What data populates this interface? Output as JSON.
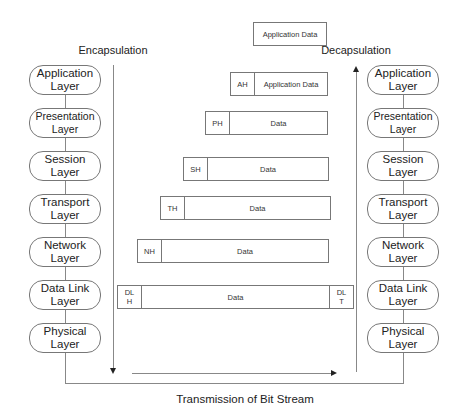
{
  "diagram": {
    "encapsulation_label": "Encapsulation",
    "decapsulation_label": "Decapsulation",
    "transmission_label": "Transmission of Bit Stream",
    "top_data_label": "Application Data",
    "layers_left": [
      {
        "line1": "Application",
        "line2": "Layer"
      },
      {
        "line1": "Presentation",
        "line2": "Layer"
      },
      {
        "line1": "Session",
        "line2": "Layer"
      },
      {
        "line1": "Transport",
        "line2": "Layer"
      },
      {
        "line1": "Network",
        "line2": "Layer"
      },
      {
        "line1": "Data Link",
        "line2": "Layer"
      },
      {
        "line1": "Physical",
        "line2": "Layer"
      }
    ],
    "layers_right": [
      {
        "line1": "Application",
        "line2": "Layer"
      },
      {
        "line1": "Presentation",
        "line2": "Layer"
      },
      {
        "line1": "Session",
        "line2": "Layer"
      },
      {
        "line1": "Transport",
        "line2": "Layer"
      },
      {
        "line1": "Network",
        "line2": "Layer"
      },
      {
        "line1": "Data Link",
        "line2": "Layer"
      },
      {
        "line1": "Physical",
        "line2": "Layer"
      }
    ],
    "packets": [
      {
        "header": "AH",
        "body": "Application Data"
      },
      {
        "header": "PH",
        "body": "Data"
      },
      {
        "header": "SH",
        "body": "Data"
      },
      {
        "header": "TH",
        "body": "Data"
      },
      {
        "header": "NH",
        "body": "Data"
      },
      {
        "header_line1": "DL",
        "header_line2": "H",
        "body": "Data",
        "trailer_line1": "DL",
        "trailer_line2": "T"
      }
    ]
  }
}
